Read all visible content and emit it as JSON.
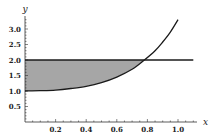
{
  "chart_data": {
    "type": "area",
    "title": "",
    "xlabel": "x",
    "ylabel": "y",
    "xlim": [
      0,
      1.05
    ],
    "ylim": [
      0,
      3.3
    ],
    "x_ticks": [
      "0.2",
      "0.4",
      "0.6",
      "0.8",
      "1.0"
    ],
    "y_ticks": [
      "0.5",
      "1.0",
      "1.5",
      "2.0",
      "2.5",
      "3.0"
    ],
    "grid": false,
    "legend": null,
    "series": [
      {
        "name": "curve",
        "x": [
          0,
          0.1,
          0.2,
          0.3,
          0.4,
          0.5,
          0.6,
          0.7,
          0.78,
          0.85,
          0.9,
          0.95,
          1.0
        ],
        "y": [
          1.0,
          1.01,
          1.03,
          1.08,
          1.15,
          1.27,
          1.45,
          1.7,
          2.0,
          2.3,
          2.58,
          2.9,
          3.3
        ]
      },
      {
        "name": "horizontal line y=2",
        "x": [
          0,
          1.1
        ],
        "y": [
          2,
          2
        ]
      }
    ],
    "shaded_region": {
      "description": "Region between y=2 and the curve from x=0 to intersection",
      "x_range": [
        0,
        0.78
      ],
      "upper": "y=2",
      "lower": "curve",
      "color": "#a6a6a6"
    },
    "intersection": {
      "x": 0.78,
      "y": 2.0
    }
  },
  "colors": {
    "curve": "#1a1a1a",
    "line": "#1a1a1a",
    "fill": "#a6a6a6",
    "axis": "#333333"
  }
}
